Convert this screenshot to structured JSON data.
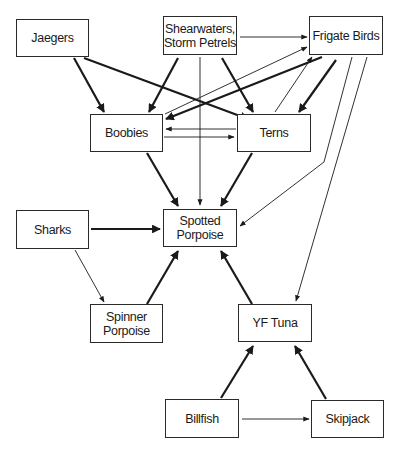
{
  "diagram": {
    "type": "food-web",
    "nodes": [
      {
        "id": "jaegers",
        "label": "Jaegers",
        "x": 16,
        "y": 19,
        "w": 73,
        "h": 38
      },
      {
        "id": "shearwaters",
        "label": "Shearwaters,\nStorm Petrels",
        "x": 163,
        "y": 16,
        "w": 74,
        "h": 39
      },
      {
        "id": "frigate",
        "label": "Frigate Birds",
        "x": 309,
        "y": 16,
        "w": 74,
        "h": 39
      },
      {
        "id": "boobies",
        "label": "Boobies",
        "x": 90,
        "y": 114,
        "w": 73,
        "h": 38
      },
      {
        "id": "terns",
        "label": "Terns",
        "x": 237,
        "y": 114,
        "w": 74,
        "h": 38
      },
      {
        "id": "spotted",
        "label": "Spotted\nPorpoise",
        "x": 163,
        "y": 209,
        "w": 74,
        "h": 38
      },
      {
        "id": "sharks",
        "label": "Sharks",
        "x": 16,
        "y": 210,
        "w": 73,
        "h": 39
      },
      {
        "id": "spinner",
        "label": "Spinner\nPorpoise",
        "x": 90,
        "y": 304,
        "w": 73,
        "h": 39
      },
      {
        "id": "yftuna",
        "label": "YF Tuna",
        "x": 238,
        "y": 304,
        "w": 74,
        "h": 38
      },
      {
        "id": "billfish",
        "label": "Billfish",
        "x": 165,
        "y": 399,
        "w": 74,
        "h": 39
      },
      {
        "id": "skipjack",
        "label": "Skipjack",
        "x": 311,
        "y": 400,
        "w": 73,
        "h": 38
      }
    ],
    "edges": [
      {
        "from": "jaegers",
        "to": "boobies",
        "weight": "thick",
        "points": [
          [
            74,
            58
          ],
          [
            104,
            112
          ]
        ]
      },
      {
        "from": "jaegers",
        "to": "terns",
        "weight": "thick",
        "points": [
          [
            84,
            58
          ],
          [
            248,
            119
          ]
        ]
      },
      {
        "from": "shearwaters",
        "to": "boobies",
        "weight": "thick",
        "points": [
          [
            178,
            58
          ],
          [
            149,
            112
          ]
        ]
      },
      {
        "from": "shearwaters",
        "to": "frigate",
        "weight": "thin",
        "points": [
          [
            240,
            37
          ],
          [
            307,
            37
          ]
        ]
      },
      {
        "from": "shearwaters",
        "to": "spotted",
        "weight": "thin",
        "points": [
          [
            200,
            57
          ],
          [
            200,
            205
          ]
        ]
      },
      {
        "from": "shearwaters",
        "to": "terns",
        "weight": "thick",
        "points": [
          [
            222,
            58
          ],
          [
            253,
            112
          ]
        ]
      },
      {
        "from": "boobies",
        "to": "frigate",
        "weight": "thin",
        "points": [
          [
            165,
            114
          ],
          [
            307,
            47
          ]
        ]
      },
      {
        "from": "frigate",
        "to": "boobies",
        "weight": "thick",
        "points": [
          [
            322,
            57
          ],
          [
            166,
            119
          ]
        ]
      },
      {
        "from": "terns",
        "to": "frigate",
        "weight": "thin",
        "points": [
          [
            275,
            112
          ],
          [
            312,
            57
          ]
        ]
      },
      {
        "from": "frigate",
        "to": "terns",
        "weight": "thick",
        "points": [
          [
            336,
            60
          ],
          [
            299,
            112
          ]
        ]
      },
      {
        "from": "terns",
        "to": "boobies",
        "weight": "thin",
        "points": [
          [
            236,
            129
          ],
          [
            166,
            129
          ]
        ]
      },
      {
        "from": "boobies",
        "to": "terns",
        "weight": "thin",
        "points": [
          [
            164,
            137
          ],
          [
            234,
            137
          ]
        ]
      },
      {
        "from": "boobies",
        "to": "spotted",
        "weight": "thick",
        "points": [
          [
            147,
            153
          ],
          [
            178,
            206
          ]
        ]
      },
      {
        "from": "terns",
        "to": "spotted",
        "weight": "thick",
        "points": [
          [
            252,
            153
          ],
          [
            221,
            206
          ]
        ]
      },
      {
        "from": "frigate",
        "to": "spotted",
        "weight": "thin",
        "points": [
          [
            352,
            57
          ],
          [
            324,
            162
          ],
          [
            240,
            226
          ]
        ]
      },
      {
        "from": "frigate",
        "to": "yftuna",
        "weight": "thin",
        "points": [
          [
            367,
            57
          ],
          [
            296,
            301
          ]
        ]
      },
      {
        "from": "sharks",
        "to": "spotted",
        "weight": "thick",
        "points": [
          [
            91,
            229
          ],
          [
            160,
            229
          ]
        ]
      },
      {
        "from": "sharks",
        "to": "spinner",
        "weight": "thin",
        "points": [
          [
            75,
            250
          ],
          [
            104,
            302
          ]
        ]
      },
      {
        "from": "spinner",
        "to": "spotted",
        "weight": "thick",
        "points": [
          [
            147,
            304
          ],
          [
            178,
            251
          ]
        ]
      },
      {
        "from": "yftuna",
        "to": "spotted",
        "weight": "thick",
        "points": [
          [
            252,
            304
          ],
          [
            221,
            251
          ]
        ]
      },
      {
        "from": "billfish",
        "to": "yftuna",
        "weight": "thick",
        "points": [
          [
            221,
            398
          ],
          [
            253,
            346
          ]
        ]
      },
      {
        "from": "skipjack",
        "to": "yftuna",
        "weight": "thick",
        "points": [
          [
            326,
            399
          ],
          [
            295,
            346
          ]
        ]
      },
      {
        "from": "billfish",
        "to": "skipjack",
        "weight": "thin",
        "points": [
          [
            242,
            419
          ],
          [
            309,
            419
          ]
        ]
      }
    ]
  }
}
